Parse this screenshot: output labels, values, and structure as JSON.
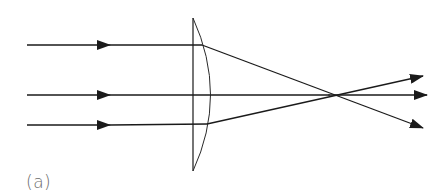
{
  "figure": {
    "label": "(a)",
    "colors": {
      "line": "#1a1a1a",
      "lens": "#2a2a2a",
      "label": "#6a6a6a",
      "background": "#ffffff"
    },
    "lens": {
      "type": "plano-convex",
      "flat_x": 193,
      "top_y": 18,
      "bottom_y": 171,
      "bulge_x": 210
    },
    "focal_point": {
      "x": 329,
      "y": 95
    },
    "incoming_rays": [
      {
        "y": 45,
        "start_x": 27,
        "lens_x": 202
      },
      {
        "y": 95,
        "start_x": 27,
        "lens_x": 210
      },
      {
        "y": 125,
        "start_x": 27,
        "lens_x": 207
      }
    ],
    "outgoing_rays": [
      {
        "from": [
          202,
          45
        ],
        "to": [
          423,
          128
        ]
      },
      {
        "from": [
          210,
          95
        ],
        "to": [
          427,
          95
        ]
      },
      {
        "from": [
          207,
          124
        ],
        "to": [
          423,
          76
        ]
      }
    ]
  }
}
